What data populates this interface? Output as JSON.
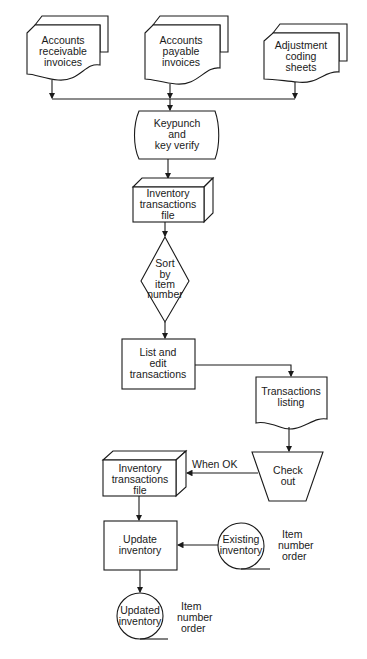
{
  "diagram": {
    "type": "system flowchart",
    "nodes": {
      "ar_invoices": {
        "kind": "document",
        "lines": [
          "Accounts",
          "receivable",
          "invoices"
        ]
      },
      "ap_invoices": {
        "kind": "document",
        "lines": [
          "Accounts",
          "payable",
          "invoices"
        ]
      },
      "adjustment_sheets": {
        "kind": "document",
        "lines": [
          "Adjustment",
          "coding",
          "sheets"
        ]
      },
      "keypunch": {
        "kind": "offline-keyboard",
        "lines": [
          "Keypunch",
          "and",
          "key verify"
        ]
      },
      "transactions_file_1": {
        "kind": "file-box",
        "lines": [
          "Inventory",
          "transactions",
          "file"
        ]
      },
      "sort": {
        "kind": "decision/sort",
        "lines": [
          "Sort",
          "by",
          "item",
          "number"
        ]
      },
      "list_edit": {
        "kind": "process",
        "lines": [
          "List and",
          "edit",
          "transactions"
        ]
      },
      "transactions_listing": {
        "kind": "document",
        "lines": [
          "Transactions",
          "listing"
        ]
      },
      "check_out": {
        "kind": "manual-operation",
        "lines": [
          "Check",
          "out"
        ]
      },
      "transactions_file_2": {
        "kind": "file-box",
        "lines": [
          "Inventory",
          "transactions",
          "file"
        ]
      },
      "update_inventory": {
        "kind": "process",
        "lines": [
          "Update",
          "inventory"
        ]
      },
      "existing_inventory": {
        "kind": "tape",
        "lines": [
          "Existing",
          "inventory"
        ]
      },
      "updated_inventory": {
        "kind": "tape",
        "lines": [
          "Updated",
          "inventory"
        ]
      }
    },
    "annotations": {
      "existing_order": [
        "Item",
        "number",
        "order"
      ],
      "updated_order": [
        "Item",
        "number",
        "order"
      ],
      "when_ok": "When OK"
    },
    "edges": [
      [
        "ar_invoices",
        "keypunch"
      ],
      [
        "ap_invoices",
        "keypunch"
      ],
      [
        "adjustment_sheets",
        "keypunch"
      ],
      [
        "keypunch",
        "transactions_file_1"
      ],
      [
        "transactions_file_1",
        "sort"
      ],
      [
        "sort",
        "list_edit"
      ],
      [
        "list_edit",
        "transactions_listing"
      ],
      [
        "transactions_listing",
        "check_out"
      ],
      [
        "check_out",
        "transactions_file_2"
      ],
      [
        "transactions_file_2",
        "update_inventory"
      ],
      [
        "existing_inventory",
        "update_inventory"
      ],
      [
        "update_inventory",
        "updated_inventory"
      ]
    ]
  }
}
